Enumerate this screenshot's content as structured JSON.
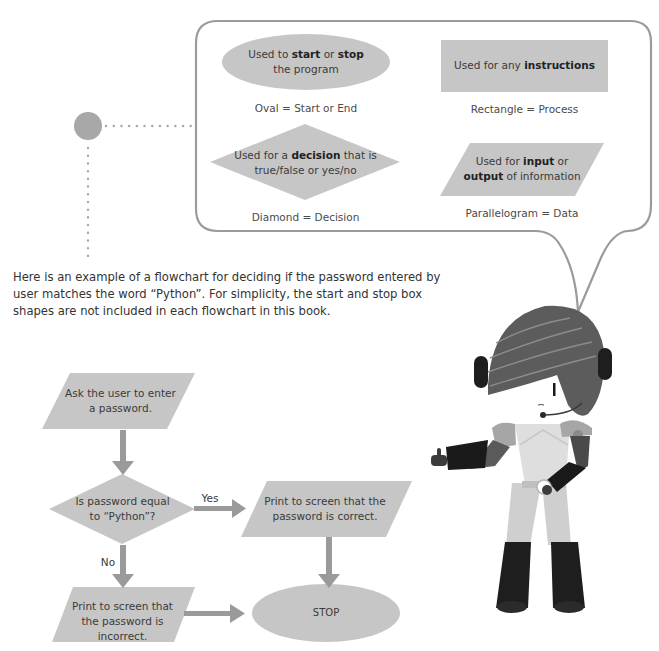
{
  "colors": {
    "shape_fill": "#c6c6c6",
    "arrow": "#9a9a9a",
    "bubble_stroke": "#9b9b9b",
    "dot": "#a8a8a8",
    "text": "#3a3a3a"
  },
  "legend": {
    "oval": {
      "text_pre": "Used to ",
      "bold1": "start",
      "text_mid": " or ",
      "bold2": "stop",
      "line2": "the program",
      "caption": "Oval = Start or End"
    },
    "rectangle": {
      "text_pre": "Used for any ",
      "bold": "instructions",
      "caption": "Rectangle = Process"
    },
    "diamond": {
      "text_pre": "Used for a ",
      "bold": "decision",
      "text_post": " that is",
      "line2": "true/false or yes/no",
      "caption": "Diamond = Decision"
    },
    "parallelogram": {
      "text_pre": "Used for ",
      "bold1": "input",
      "text_mid": " or",
      "bold2": "output",
      "text_post": " of information",
      "caption": "Parallelogram = Data"
    }
  },
  "paragraph": "Here is an example of a flowchart for deciding if the password entered by user matches the word “Python”. For simplicity, the start and stop box shapes are not included in each flowchart in this book.",
  "flowchart": {
    "input": {
      "line1": "Ask the user to enter",
      "line2": "a password."
    },
    "decision": {
      "line1": "Is password equal",
      "line2": "to “Python”?"
    },
    "yes_label": "Yes",
    "no_label": "No",
    "correct": {
      "line1": "Print to screen that the",
      "line2": "password is correct."
    },
    "incorrect": {
      "line1": "Print to screen that",
      "line2": "the password is incorrect."
    },
    "stop": "STOP"
  },
  "character": {
    "name": "robot-mascot"
  }
}
